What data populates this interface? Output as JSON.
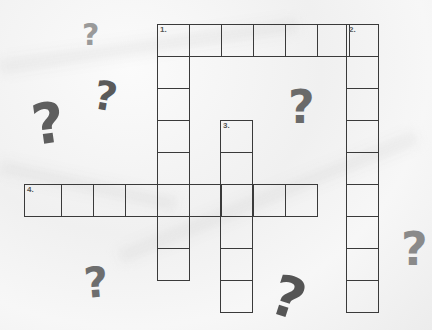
{
  "puzzle": {
    "type": "crossword",
    "cell_size": 32,
    "stroke_color": "#3a3a3a",
    "clues": [
      {
        "number": "1.",
        "direction": "across+down",
        "label": "1."
      },
      {
        "number": "2.",
        "direction": "down",
        "label": "2."
      },
      {
        "number": "3.",
        "direction": "down",
        "label": "3."
      },
      {
        "number": "4.",
        "direction": "across",
        "label": "4."
      }
    ],
    "words": [
      {
        "id": "1-across",
        "label": "1.",
        "x": 157,
        "y": 24,
        "dir": "across",
        "length": 6
      },
      {
        "id": "1-down",
        "label": "",
        "x": 157,
        "y": 24,
        "dir": "down",
        "length": 8
      },
      {
        "id": "2-down",
        "label": "2.",
        "x": 346,
        "y": 24,
        "dir": "down",
        "length": 9
      },
      {
        "id": "3-down",
        "label": "3.",
        "x": 220,
        "y": 120,
        "dir": "down",
        "length": 6
      },
      {
        "id": "4-across",
        "label": "4.",
        "x": 24,
        "y": 184,
        "dir": "across",
        "length": 9
      }
    ]
  },
  "decorations": {
    "question_marks": [
      {
        "glyph": "?",
        "x": 82,
        "y": 20,
        "size": 30,
        "rotate": 0,
        "color": "#9a9a9a"
      },
      {
        "glyph": "?",
        "x": 94,
        "y": 76,
        "size": 40,
        "rotate": 10,
        "color": "#5a5a5a"
      },
      {
        "glyph": "?",
        "x": 32,
        "y": 96,
        "size": 56,
        "rotate": -8,
        "color": "#5e5e5e"
      },
      {
        "glyph": "?",
        "x": 288,
        "y": 84,
        "size": 46,
        "rotate": 0,
        "color": "#6a6a6a"
      },
      {
        "glyph": "?",
        "x": 84,
        "y": 262,
        "size": 42,
        "rotate": -5,
        "color": "#6e6e6e"
      },
      {
        "glyph": "?",
        "x": 401,
        "y": 226,
        "size": 46,
        "rotate": 0,
        "color": "#8a8a8a"
      },
      {
        "glyph": "?",
        "x": 272,
        "y": 270,
        "size": 56,
        "rotate": 18,
        "color": "#555555"
      }
    ]
  }
}
